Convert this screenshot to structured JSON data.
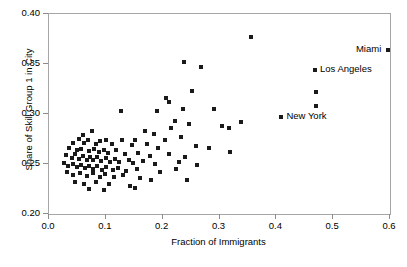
{
  "chart_data": {
    "type": "scatter",
    "title": "",
    "xlabel": "Fraction of Immigrants",
    "ylabel": "Share of Skill Group 1 in City",
    "xlim": [
      0.0,
      0.6
    ],
    "ylim": [
      0.2,
      0.4
    ],
    "xticks": [
      "0.0",
      "0.1",
      "0.2",
      "0.3",
      "0.4",
      "0.5",
      "0.6"
    ],
    "xtick_values": [
      0.0,
      0.1,
      0.2,
      0.3,
      0.4,
      0.5,
      0.6
    ],
    "yticks": [
      "0.20",
      "0.25",
      "0.30",
      "0.35",
      "0.40"
    ],
    "ytick_values": [
      0.2,
      0.25,
      0.3,
      0.35,
      0.4
    ],
    "grid": false,
    "legend": null,
    "marker": "square",
    "marker_color": "#1a1a1a",
    "marker_size_px": 4,
    "annotations": [
      {
        "text": "Miami",
        "x": 0.597,
        "y": 0.3645,
        "align": "right"
      },
      {
        "text": "Los Angeles",
        "x": 0.468,
        "y": 0.3445,
        "align": "left"
      },
      {
        "text": "New York",
        "x": 0.409,
        "y": 0.2975,
        "align": "left"
      }
    ],
    "points": [
      {
        "x": 0.597,
        "y": 0.3645
      },
      {
        "x": 0.468,
        "y": 0.3445
      },
      {
        "x": 0.47,
        "y": 0.3225
      },
      {
        "x": 0.47,
        "y": 0.3085
      },
      {
        "x": 0.409,
        "y": 0.2975
      },
      {
        "x": 0.355,
        "y": 0.3775
      },
      {
        "x": 0.29,
        "y": 0.3055
      },
      {
        "x": 0.337,
        "y": 0.292
      },
      {
        "x": 0.237,
        "y": 0.352
      },
      {
        "x": 0.268,
        "y": 0.347
      },
      {
        "x": 0.252,
        "y": 0.323
      },
      {
        "x": 0.205,
        "y": 0.3165
      },
      {
        "x": 0.212,
        "y": 0.312
      },
      {
        "x": 0.236,
        "y": 0.3055
      },
      {
        "x": 0.19,
        "y": 0.3035
      },
      {
        "x": 0.127,
        "y": 0.303
      },
      {
        "x": 0.222,
        "y": 0.2935
      },
      {
        "x": 0.247,
        "y": 0.2905
      },
      {
        "x": 0.305,
        "y": 0.288
      },
      {
        "x": 0.316,
        "y": 0.286
      },
      {
        "x": 0.214,
        "y": 0.286
      },
      {
        "x": 0.169,
        "y": 0.2835
      },
      {
        "x": 0.184,
        "y": 0.2805
      },
      {
        "x": 0.075,
        "y": 0.2835
      },
      {
        "x": 0.06,
        "y": 0.279
      },
      {
        "x": 0.232,
        "y": 0.2775
      },
      {
        "x": 0.204,
        "y": 0.274
      },
      {
        "x": 0.152,
        "y": 0.2745
      },
      {
        "x": 0.1,
        "y": 0.2745
      },
      {
        "x": 0.128,
        "y": 0.274
      },
      {
        "x": 0.052,
        "y": 0.2755
      },
      {
        "x": 0.068,
        "y": 0.274
      },
      {
        "x": 0.042,
        "y": 0.271
      },
      {
        "x": 0.062,
        "y": 0.2715
      },
      {
        "x": 0.082,
        "y": 0.2705
      },
      {
        "x": 0.09,
        "y": 0.2735
      },
      {
        "x": 0.11,
        "y": 0.27
      },
      {
        "x": 0.146,
        "y": 0.269
      },
      {
        "x": 0.173,
        "y": 0.27
      },
      {
        "x": 0.192,
        "y": 0.2665
      },
      {
        "x": 0.258,
        "y": 0.268
      },
      {
        "x": 0.281,
        "y": 0.2665
      },
      {
        "x": 0.318,
        "y": 0.2625
      },
      {
        "x": 0.036,
        "y": 0.2665
      },
      {
        "x": 0.049,
        "y": 0.264
      },
      {
        "x": 0.057,
        "y": 0.2655
      },
      {
        "x": 0.07,
        "y": 0.263
      },
      {
        "x": 0.079,
        "y": 0.2655
      },
      {
        "x": 0.088,
        "y": 0.262
      },
      {
        "x": 0.097,
        "y": 0.2645
      },
      {
        "x": 0.104,
        "y": 0.261
      },
      {
        "x": 0.118,
        "y": 0.264
      },
      {
        "x": 0.134,
        "y": 0.26
      },
      {
        "x": 0.157,
        "y": 0.2615
      },
      {
        "x": 0.178,
        "y": 0.2585
      },
      {
        "x": 0.212,
        "y": 0.26
      },
      {
        "x": 0.24,
        "y": 0.2575
      },
      {
        "x": 0.03,
        "y": 0.259
      },
      {
        "x": 0.04,
        "y": 0.2565
      },
      {
        "x": 0.046,
        "y": 0.26
      },
      {
        "x": 0.053,
        "y": 0.2555
      },
      {
        "x": 0.06,
        "y": 0.2585
      },
      {
        "x": 0.066,
        "y": 0.2545
      },
      {
        "x": 0.072,
        "y": 0.2575
      },
      {
        "x": 0.078,
        "y": 0.254
      },
      {
        "x": 0.084,
        "y": 0.257
      },
      {
        "x": 0.092,
        "y": 0.2535
      },
      {
        "x": 0.1,
        "y": 0.256
      },
      {
        "x": 0.108,
        "y": 0.2525
      },
      {
        "x": 0.116,
        "y": 0.2555
      },
      {
        "x": 0.124,
        "y": 0.252
      },
      {
        "x": 0.14,
        "y": 0.2545
      },
      {
        "x": 0.148,
        "y": 0.251
      },
      {
        "x": 0.165,
        "y": 0.2535
      },
      {
        "x": 0.186,
        "y": 0.2505
      },
      {
        "x": 0.228,
        "y": 0.252
      },
      {
        "x": 0.26,
        "y": 0.249
      },
      {
        "x": 0.026,
        "y": 0.251
      },
      {
        "x": 0.034,
        "y": 0.248
      },
      {
        "x": 0.043,
        "y": 0.2505
      },
      {
        "x": 0.05,
        "y": 0.247
      },
      {
        "x": 0.057,
        "y": 0.2495
      },
      {
        "x": 0.064,
        "y": 0.246
      },
      {
        "x": 0.071,
        "y": 0.2485
      },
      {
        "x": 0.077,
        "y": 0.245
      },
      {
        "x": 0.085,
        "y": 0.248
      },
      {
        "x": 0.093,
        "y": 0.2445
      },
      {
        "x": 0.101,
        "y": 0.247
      },
      {
        "x": 0.112,
        "y": 0.244
      },
      {
        "x": 0.122,
        "y": 0.2465
      },
      {
        "x": 0.136,
        "y": 0.2435
      },
      {
        "x": 0.155,
        "y": 0.2455
      },
      {
        "x": 0.196,
        "y": 0.2425
      },
      {
        "x": 0.223,
        "y": 0.245
      },
      {
        "x": 0.031,
        "y": 0.242
      },
      {
        "x": 0.042,
        "y": 0.2395
      },
      {
        "x": 0.054,
        "y": 0.2415
      },
      {
        "x": 0.066,
        "y": 0.2385
      },
      {
        "x": 0.078,
        "y": 0.241
      },
      {
        "x": 0.089,
        "y": 0.2375
      },
      {
        "x": 0.099,
        "y": 0.24
      },
      {
        "x": 0.115,
        "y": 0.237
      },
      {
        "x": 0.13,
        "y": 0.239
      },
      {
        "x": 0.16,
        "y": 0.2365
      },
      {
        "x": 0.18,
        "y": 0.234
      },
      {
        "x": 0.243,
        "y": 0.2345
      },
      {
        "x": 0.045,
        "y": 0.232
      },
      {
        "x": 0.061,
        "y": 0.2305
      },
      {
        "x": 0.083,
        "y": 0.2325
      },
      {
        "x": 0.105,
        "y": 0.23
      },
      {
        "x": 0.142,
        "y": 0.228
      },
      {
        "x": 0.152,
        "y": 0.2265
      },
      {
        "x": 0.07,
        "y": 0.2255
      },
      {
        "x": 0.096,
        "y": 0.224
      }
    ]
  }
}
